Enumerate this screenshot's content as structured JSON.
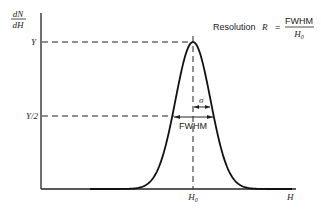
{
  "resolution_label": "Resolution",
  "resolution_symbol": "R",
  "equals": "=",
  "fraction_numerator": "FWHM",
  "fraction_denominator_main": "H",
  "fraction_denominator_sub": "0",
  "y_axis_label_numerator": "dN",
  "y_axis_label_denominator": "dH",
  "x_axis_label": "H",
  "peak_label_main": "H",
  "peak_label_sub": "0",
  "y_peak_label": "Y",
  "y_half_label": "Y/2",
  "sigma_label": "σ",
  "fwhm_label": "FWHM",
  "chart_data": {
    "type": "line",
    "xlabel": "H",
    "ylabel": "dN/dH",
    "curve": "gaussian",
    "peak_position_label": "H0",
    "peak_height_label": "Y",
    "half_height_label": "Y/2",
    "annotations": [
      "σ",
      "FWHM"
    ],
    "grid": false
  }
}
